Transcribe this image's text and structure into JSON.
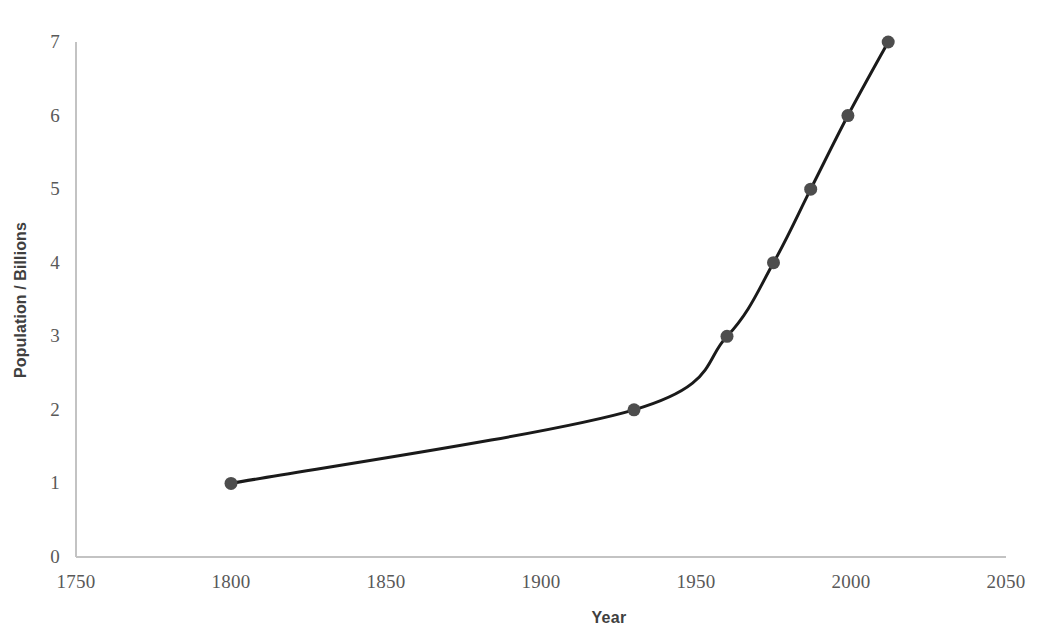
{
  "chart_data": {
    "type": "line",
    "title": "",
    "subtitle": "",
    "xlabel": "Year",
    "ylabel": "Population / Billions",
    "xlim": [
      1750,
      2050
    ],
    "ylim": [
      0,
      7
    ],
    "grid": false,
    "legend": null,
    "legend_position": "none",
    "x_ticks": [
      1750,
      1800,
      1850,
      1900,
      1950,
      2000,
      2050
    ],
    "x_tick_labels": [
      "1750",
      "1800",
      "1850",
      "1900",
      "1950",
      "2000",
      "2050"
    ],
    "y_ticks": [
      0,
      1,
      2,
      3,
      4,
      5,
      6,
      7
    ],
    "y_tick_labels": [
      "0",
      "1",
      "2",
      "3",
      "4",
      "5",
      "6",
      "7"
    ],
    "series": [
      {
        "name": "World population",
        "x": [
          1800,
          1930,
          1960,
          1975,
          1987,
          1999,
          2012
        ],
        "values": [
          1,
          2,
          3,
          4,
          5,
          6,
          7
        ],
        "marker": "circle",
        "marker_color": "#4d4d4d",
        "line_color": "#1a1a1a",
        "line_width": 3,
        "marker_size": 13,
        "smooth": true
      }
    ],
    "annotations": [],
    "colors": {
      "line": "#1a1a1a",
      "marker": "#4d4d4d",
      "axis": "#bfbfbf",
      "tick_text": "#595959",
      "title_text": "#3f3f3f",
      "background": "#ffffff"
    },
    "geometry": {
      "x_pixel_min": 76,
      "x_pixel_max": 1006,
      "y_pixel_min": 42,
      "y_pixel_max": 557
    }
  }
}
